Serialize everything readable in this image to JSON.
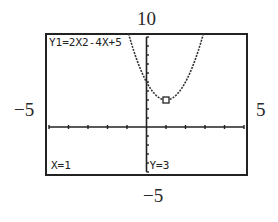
{
  "window": {
    "xmin_label": "−5",
    "xmax_label": "5",
    "ymin_label": "−5",
    "ymax_label": "10"
  },
  "screen": {
    "equation": "Y1=2X²−4X+5",
    "equation_display": "Y1=2X2-4X+5",
    "cursor_x_readout": "X=1",
    "cursor_y_readout": "Y=3"
  },
  "colors": {
    "frame": "#222222",
    "curve": "#333333",
    "background": "#ffffff"
  },
  "chart_data": {
    "type": "line",
    "function": "2x^2 - 4x + 5",
    "xlabel": "",
    "ylabel": "",
    "xlim": [
      -5,
      5
    ],
    "ylim": [
      -5,
      10
    ],
    "xscale": 1,
    "yscale": 1,
    "grid": false,
    "series": [
      {
        "name": "Y1",
        "x": [
          -0.5,
          -0.25,
          0,
          0.25,
          0.5,
          0.75,
          1,
          1.25,
          1.5,
          1.75,
          2,
          2.25,
          2.5,
          2.75
        ],
        "values": [
          7.5,
          6.125,
          5,
          4.125,
          3.5,
          3.125,
          3,
          3.125,
          3.5,
          4.125,
          5,
          6.125,
          7.5,
          9.125
        ]
      }
    ],
    "annotations": [
      {
        "type": "trace-cursor",
        "x": 1,
        "y": 3,
        "label": "X=1  Y=3"
      }
    ]
  }
}
